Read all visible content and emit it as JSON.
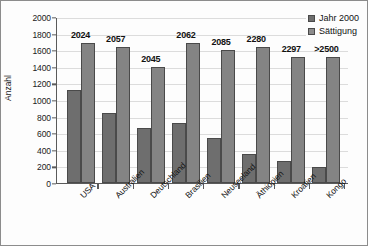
{
  "chart_data": {
    "type": "bar",
    "title": "",
    "xlabel": "",
    "ylabel": "Anzahl",
    "ylim": [
      0,
      2000
    ],
    "ytick_step": 200,
    "yticks": [
      2000,
      1800,
      1600,
      1400,
      1200,
      1000,
      800,
      600,
      400,
      200,
      0
    ],
    "grid": true,
    "legend_position": "top-right",
    "categories": [
      "USA",
      "Australien",
      "Deutschland",
      "Brasilien",
      "Neuseeland",
      "Äthiopien",
      "Kroatien",
      "Kongo"
    ],
    "series": [
      {
        "name": "Jahr 2000",
        "color": "#6e6e6e",
        "values": [
          1120,
          840,
          660,
          720,
          545,
          355,
          265,
          190
        ]
      },
      {
        "name": "Sättigung",
        "color": "#848484",
        "values": [
          1690,
          1640,
          1395,
          1690,
          1605,
          1635,
          1520,
          1520
        ]
      }
    ],
    "annotations": [
      "2024",
      "2057",
      "2045",
      "2062",
      "2085",
      "2280",
      "2297",
      ">2500"
    ]
  },
  "legend": {
    "items": [
      {
        "label": "Jahr 2000"
      },
      {
        "label": "Sättigung"
      }
    ]
  }
}
